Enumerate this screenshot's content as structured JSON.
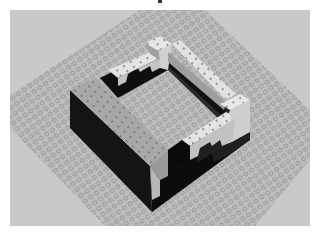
{
  "image": {
    "description": "3D render of a grey LEGO-style square wall enclosure on a studded baseplate",
    "width": 324,
    "height": 234
  },
  "colors": {
    "page_background": "#ffffff",
    "render_background": "#c9c9c9",
    "baseplate": "#bdbdbd",
    "stud_outline": "#8f8f8f",
    "brick_white": "#e4e4e4",
    "brick_light_gray": "#a8a8a8",
    "brick_mid_gray": "#8a8a8a",
    "brick_dark": "#111111",
    "brick_shadow": "#2a2a2a",
    "stud_dot": "#6a6a6a"
  },
  "scene": {
    "label": "LEGO brick enclosure on baseplate",
    "objects": [
      {
        "name": "baseplate",
        "label": "Studded baseplate"
      },
      {
        "name": "left-wall",
        "label": "Left wall (gray bricks, dark outer face)"
      },
      {
        "name": "back-wall",
        "label": "Back wall (white bricks, stepped)"
      },
      {
        "name": "right-wall",
        "label": "Right wall (white bricks, stepped)"
      },
      {
        "name": "front-wall",
        "label": "Front wall (white bricks)"
      }
    ]
  }
}
